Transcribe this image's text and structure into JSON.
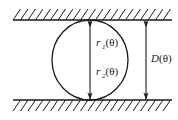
{
  "figure": {
    "type": "geometry-diagram",
    "background_color": "#ffffff",
    "line_color": "#1a1a1a"
  },
  "labels": {
    "r1": {
      "base": "r",
      "subscript": "1",
      "argument": "(θ)",
      "full": "r₁(θ)"
    },
    "r2": {
      "base": "r",
      "subscript": "2",
      "argument": "(θ)",
      "full": "r₂(θ)"
    },
    "D": {
      "base": "D",
      "subscript": "",
      "argument": "(θ)",
      "full": "D(θ)"
    }
  },
  "geometry": {
    "top_wall_y": 20,
    "bottom_wall_y": 100,
    "wall_x_start": 13,
    "wall_x_end": 172,
    "hatch_count": 21,
    "hatch_length": 11,
    "hatch_lean": "right",
    "circle": {
      "cx": 90,
      "cy": 60,
      "rx": 38,
      "ry": 40
    },
    "inner_dimension_line_x": 90,
    "outer_dimension_line_x": 146,
    "arrow_direction_top": "down",
    "arrow_direction_bottom": "down"
  }
}
